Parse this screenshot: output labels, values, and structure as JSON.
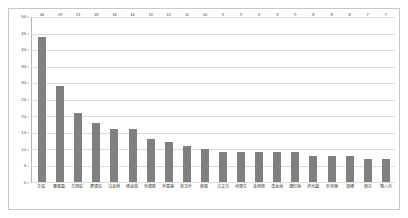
{
  "chart_data": {
    "type": "bar",
    "title": "",
    "subtitle": "",
    "xlabel": "",
    "ylabel": "",
    "ylim": [
      0,
      50
    ],
    "ytick_step": 5,
    "yticks": [
      0,
      5,
      10,
      15,
      20,
      25,
      30,
      35,
      40,
      45,
      50
    ],
    "ytick_labels": [
      "0",
      "5",
      "10",
      "15",
      "20",
      "25",
      "30",
      "35",
      "40",
      "45",
      "50"
    ],
    "grid": true,
    "grid_axis": "y",
    "legend": false,
    "legend_position": "none",
    "bar_color": "#808080",
    "gridline_color": "#dcdcdc",
    "axis_color": "#b5b5b5",
    "frame_color": "#c8c8c8",
    "background": "#ffffff",
    "show_value_labels": true,
    "categories": [
      "王成",
      "曹春磊",
      "王国虹",
      "翟建柱",
      "马金林",
      "杨金软",
      "孙德胜",
      "孙意霖",
      "张玉叶",
      "薛春",
      "汪文凡",
      "何更生",
      "金柄辉",
      "温龙海",
      "谭红梅",
      "尹光越",
      "朴宋楠",
      "梁穗",
      "韩东",
      "隋八炎"
    ],
    "values": [
      44,
      29,
      21,
      18,
      16,
      16,
      13,
      12,
      11,
      10,
      9,
      9,
      9,
      9,
      9,
      8,
      8,
      8,
      7,
      7
    ],
    "value_labels": [
      "44",
      "29",
      "21",
      "18",
      "16",
      "16",
      "13",
      "12",
      "11",
      "10",
      "9",
      "9",
      "9",
      "9",
      "9",
      "8",
      "8",
      "8",
      "7",
      "7"
    ]
  }
}
